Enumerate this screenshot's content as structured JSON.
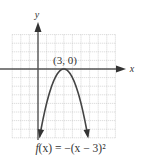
{
  "chart_data": {
    "type": "line",
    "title": "",
    "function": "f(x) = -(x - 3)^2",
    "caption": "f(x) = −(x − 3)²",
    "xlabel": "x",
    "ylabel": "y",
    "xlim": [
      -3,
      9
    ],
    "ylim": [
      -8,
      4
    ],
    "grid": true,
    "grid_step": 1,
    "legend": null,
    "annotations": [
      {
        "text": "(3, 0)",
        "x": 3,
        "y": 0,
        "label": "vertex"
      }
    ],
    "series": [
      {
        "name": "f(x) = -(x - 3)^2",
        "x": [
          0.2,
          1,
          2,
          3,
          4,
          5,
          5.8
        ],
        "y": [
          -7.84,
          -4,
          -1,
          0,
          -1,
          -4,
          -7.84
        ]
      }
    ],
    "colors": {
      "curve": "#444444",
      "axes": "#555555",
      "grid": "#bbbbbb"
    }
  },
  "labels": {
    "x_axis": "x",
    "y_axis": "y",
    "vertex": "(3, 0)",
    "caption_f": "f",
    "caption_rest": "(x) = −(x − 3)²"
  }
}
